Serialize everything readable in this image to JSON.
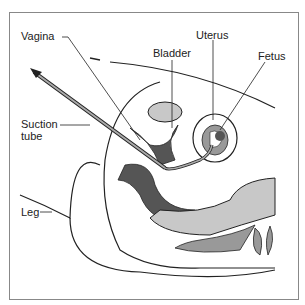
{
  "diagram": {
    "type": "medical-illustration",
    "labels": [
      {
        "id": "vagina",
        "text": "Vagina"
      },
      {
        "id": "bladder",
        "text": "Bladder"
      },
      {
        "id": "uterus",
        "text": "Uterus"
      },
      {
        "id": "fetus",
        "text": "Fetus"
      },
      {
        "id": "suction-tube",
        "text": "Suction\ntube"
      },
      {
        "id": "leg",
        "text": "Leg"
      }
    ]
  },
  "colors": {
    "dark": "#555555",
    "mid": "#999999",
    "light": "#c8c8c8",
    "line": "#222222"
  }
}
